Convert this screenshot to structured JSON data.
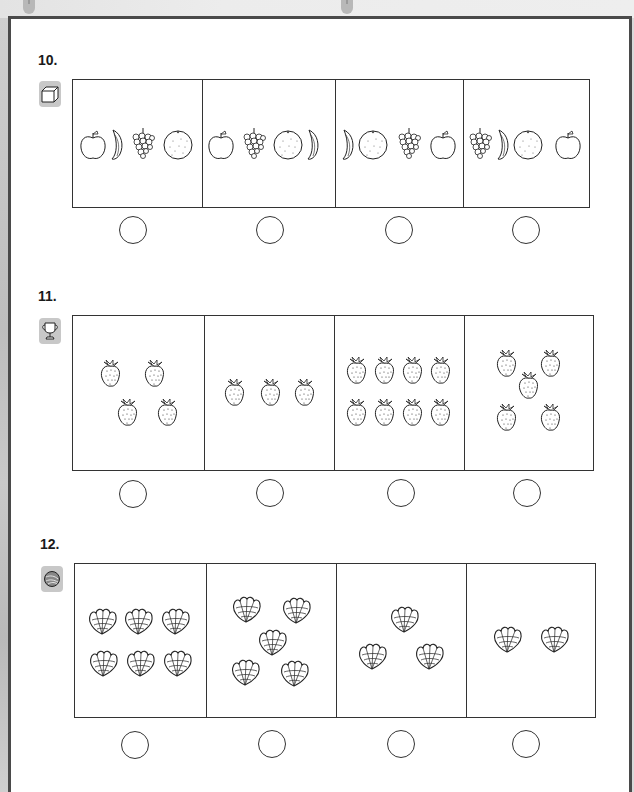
{
  "worksheet": {
    "questions": [
      {
        "number": "10.",
        "icon": "cube-icon",
        "options": [
          {
            "items": [
              "apple",
              "banana",
              "grapes",
              "orange"
            ]
          },
          {
            "items": [
              "apple",
              "grapes",
              "orange",
              "banana"
            ]
          },
          {
            "items": [
              "banana",
              "orange",
              "grapes",
              "apple"
            ]
          },
          {
            "items": [
              "grapes",
              "banana",
              "orange",
              "apple"
            ]
          }
        ]
      },
      {
        "number": "11.",
        "icon": "trophy-icon",
        "options": [
          {
            "item": "strawberry",
            "count": 4
          },
          {
            "item": "strawberry",
            "count": 3
          },
          {
            "item": "strawberry",
            "count": 8
          },
          {
            "item": "strawberry",
            "count": 5
          }
        ]
      },
      {
        "number": "12.",
        "icon": "nest-icon",
        "options": [
          {
            "item": "seashell",
            "count": 6
          },
          {
            "item": "seashell",
            "count": 5
          },
          {
            "item": "seashell",
            "count": 3
          },
          {
            "item": "seashell",
            "count": 2
          }
        ]
      }
    ]
  }
}
